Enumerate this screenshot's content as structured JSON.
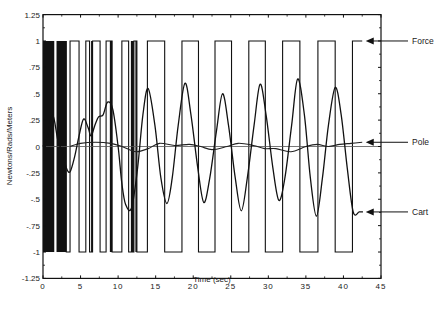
{
  "chart_data": {
    "type": "line",
    "title": "",
    "xlabel": "Time (sec)",
    "ylabel": "Newtons/Rads/Meters",
    "xlim": [
      0,
      45
    ],
    "ylim": [
      -1.25,
      1.25
    ],
    "grid": false,
    "legend_position": "right-annotations",
    "x_ticks": [
      0,
      5,
      10,
      15,
      20,
      25,
      30,
      35,
      40,
      45
    ],
    "x_tick_labels": [
      "0",
      "5",
      "10",
      "15",
      "20",
      "25",
      "30",
      "35",
      "40",
      "45"
    ],
    "y_ticks": [
      1.25,
      1,
      0.75,
      0.5,
      0.25,
      0,
      -0.25,
      -0.5,
      -0.75,
      -1,
      -1.25
    ],
    "y_tick_labels": [
      "1.25",
      "1",
      ".75",
      ".5",
      ".25",
      "0",
      "-.25",
      "-.5",
      "-.75",
      "-1",
      "-1.25"
    ],
    "series": [
      {
        "name": "Force",
        "style": "step",
        "dense_regions": [
          [
            0.0,
            1.5
          ],
          [
            1.8,
            3.1
          ],
          [
            6.4,
            6.6
          ],
          [
            8.9,
            9.2
          ],
          [
            11.7,
            12.1
          ],
          [
            12.3,
            12.5
          ]
        ],
        "switch_times": [
          3.1,
          3.6,
          4.8,
          5.7,
          6.2,
          6.6,
          7.6,
          8.4,
          9.2,
          10.5,
          11.4,
          12.1,
          12.5,
          13.9,
          16.2,
          18.5,
          20.7,
          22.9,
          25.1,
          27.4,
          29.6,
          31.9,
          34.2,
          36.6,
          38.9,
          41.2
        ],
        "initial_value_after_dense": -1,
        "end_time": 42.5,
        "end_value": 1
      },
      {
        "name": "Pole",
        "x": [
          3.6,
          5.0,
          7.0,
          9.0,
          10.5,
          11.5,
          12.5,
          14.0,
          15.5,
          17.5,
          19.5,
          21.0,
          22.5,
          24.5,
          26.0,
          28.0,
          29.5,
          31.0,
          33.0,
          35.0,
          36.5,
          38.0,
          39.5,
          41.0,
          42.5
        ],
        "y": [
          0.0,
          0.03,
          0.04,
          0.03,
          0.0,
          -0.03,
          -0.05,
          -0.02,
          0.03,
          0.01,
          0.02,
          0.0,
          -0.03,
          0.0,
          0.03,
          0.01,
          -0.02,
          -0.02,
          -0.05,
          0.0,
          0.02,
          0.0,
          0.02,
          0.03,
          0.04
        ]
      },
      {
        "name": "Cart",
        "x": [
          0.0,
          0.6,
          1.3,
          2.0,
          2.6,
          3.1,
          3.6,
          4.2,
          4.8,
          5.4,
          6.0,
          6.4,
          6.9,
          7.4,
          8.0,
          8.6,
          9.3,
          10.0,
          10.5,
          11.0,
          11.8,
          12.6,
          13.3,
          14.0,
          14.9,
          15.7,
          16.5,
          17.2,
          18.0,
          18.9,
          19.7,
          20.6,
          21.4,
          22.2,
          23.1,
          23.9,
          24.7,
          25.6,
          26.4,
          27.2,
          28.1,
          28.9,
          29.7,
          30.6,
          31.4,
          32.2,
          33.1,
          33.9,
          34.8,
          35.6,
          36.4,
          37.2,
          38.0,
          38.9,
          39.7,
          40.5,
          41.3,
          42.1,
          42.6
        ],
        "y": [
          0.0,
          0.1,
          0.3,
          0.05,
          -0.05,
          -0.2,
          -0.24,
          -0.1,
          0.1,
          0.26,
          0.18,
          0.1,
          0.2,
          0.28,
          0.3,
          0.42,
          0.35,
          0.0,
          -0.35,
          -0.55,
          -0.58,
          -0.2,
          0.3,
          0.55,
          0.2,
          -0.3,
          -0.54,
          -0.3,
          0.2,
          0.6,
          0.3,
          -0.2,
          -0.53,
          -0.3,
          0.15,
          0.5,
          0.2,
          -0.3,
          -0.61,
          -0.3,
          0.2,
          0.59,
          0.3,
          -0.2,
          -0.51,
          -0.3,
          0.2,
          0.64,
          0.3,
          -0.3,
          -0.66,
          -0.3,
          0.2,
          0.56,
          0.3,
          -0.2,
          -0.62,
          -0.62,
          -0.62
        ]
      }
    ],
    "zero_line": true,
    "annotations": [
      {
        "label": "Force",
        "arrow_to": [
          42.7,
          1.0
        ]
      },
      {
        "label": "Pole",
        "arrow_to": [
          42.7,
          0.04
        ]
      },
      {
        "label": "Cart",
        "arrow_to": [
          42.7,
          -0.62
        ]
      }
    ]
  }
}
